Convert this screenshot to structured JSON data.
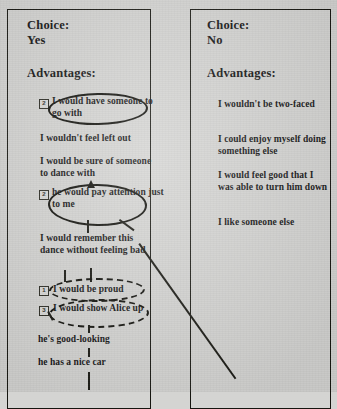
{
  "document": {
    "background_color": "#d4d4d2",
    "ink_color": "#15150f"
  },
  "panels": [
    {
      "id": "yes",
      "choice_label": "Choice:",
      "choice_value": "Yes",
      "advantages_label": "Advantages:",
      "items": [
        {
          "number": "2",
          "text": "I would have someone to go with",
          "annotation": "solid-oval"
        },
        {
          "number": "",
          "text": "I wouldn't feel left out",
          "annotation": "none"
        },
        {
          "number": "",
          "text": "I would be sure of someone to dance with",
          "annotation": "none"
        },
        {
          "number": "2",
          "text": "he would pay attention just to me",
          "annotation": "solid-oval"
        },
        {
          "number": "",
          "text": "I would remember this dance without feeling bad",
          "annotation": "none"
        },
        {
          "number": "1",
          "text": "I would be proud",
          "annotation": "dashed-oval"
        },
        {
          "number": "3",
          "text": "I would show Alice up",
          "annotation": "dashed-oval"
        },
        {
          "number": "",
          "text": "he's good-looking",
          "annotation": "none"
        },
        {
          "number": "",
          "text": "he has a nice car",
          "annotation": "none"
        }
      ]
    },
    {
      "id": "no",
      "choice_label": "Choice:",
      "choice_value": "No",
      "advantages_label": "Advantages:",
      "items": [
        {
          "number": "",
          "text": "I wouldn't be two-faced",
          "annotation": "none"
        },
        {
          "number": "",
          "text": "I could enjoy myself doing something else",
          "annotation": "none"
        },
        {
          "number": "",
          "text": "I would feel good that I was able to turn him down",
          "annotation": "none"
        },
        {
          "number": "",
          "text": "I like someone else",
          "annotation": "none"
        }
      ]
    }
  ]
}
